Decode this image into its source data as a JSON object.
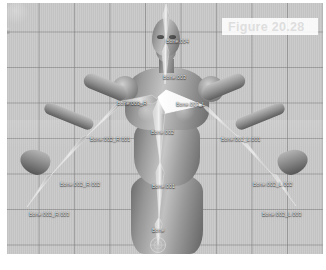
{
  "caption": {
    "text": "Figure 20.28"
  },
  "viewport": {
    "background_color": "#c9c9c9",
    "grid_line_color": "#787878",
    "label_color": "#f2f2f2",
    "selected_bone_color": "#ffffff"
  },
  "bones": [
    {
      "name": "Bone.004",
      "label": "Bone.004",
      "x": 160,
      "y": 37,
      "selected": false
    },
    {
      "name": "Bone.003",
      "label": "Bone.003",
      "x": 157,
      "y": 73,
      "selected": false
    },
    {
      "name": "Bone.003_R",
      "label": "Bone.003_R",
      "x": 117,
      "y": 99,
      "selected": false
    },
    {
      "name": "Bone.003_L",
      "label": "Bone.003_L",
      "x": 176,
      "y": 100,
      "selected": true
    },
    {
      "name": "Bone.002",
      "label": "Bone.002",
      "x": 151,
      "y": 128,
      "selected": false
    },
    {
      "name": "Bone.002_R.001",
      "label": "Bone.002_R.001",
      "x": 90,
      "y": 135,
      "selected": false
    },
    {
      "name": "Bone.002_L.001",
      "label": "Bone.002_L.001",
      "x": 221,
      "y": 135,
      "selected": false
    },
    {
      "name": "Bone.002_R.002",
      "label": "Bone.002_R.002",
      "x": 60,
      "y": 180,
      "selected": false
    },
    {
      "name": "Bone.002_L.002",
      "label": "Bone.002_L.002",
      "x": 253,
      "y": 180,
      "selected": false
    },
    {
      "name": "Bone.001",
      "label": "Bone.001",
      "x": 152,
      "y": 182,
      "selected": false
    },
    {
      "name": "Bone.002_R.003",
      "label": "Bone.002_R.003",
      "x": 29,
      "y": 210,
      "selected": false
    },
    {
      "name": "Bone.002_L.003",
      "label": "Bone.002_L.003",
      "x": 262,
      "y": 210,
      "selected": false
    },
    {
      "name": "Bone",
      "label": "Bone",
      "x": 152,
      "y": 226,
      "selected": false
    }
  ]
}
